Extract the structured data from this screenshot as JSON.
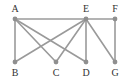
{
  "graph": {
    "nodes": [
      {
        "id": "A",
        "label": "A",
        "x": 15,
        "y": 19,
        "label_x": 15,
        "label_y": 12
      },
      {
        "id": "E",
        "label": "E",
        "x": 86,
        "y": 19,
        "label_x": 86,
        "label_y": 12
      },
      {
        "id": "F",
        "label": "F",
        "x": 115,
        "y": 19,
        "label_x": 115,
        "label_y": 12
      },
      {
        "id": "B",
        "label": "B",
        "x": 15,
        "y": 62,
        "label_x": 15,
        "label_y": 76
      },
      {
        "id": "C",
        "label": "C",
        "x": 56,
        "y": 62,
        "label_x": 56,
        "label_y": 76
      },
      {
        "id": "D",
        "label": "D",
        "x": 86,
        "y": 62,
        "label_x": 86,
        "label_y": 76
      },
      {
        "id": "G",
        "label": "G",
        "x": 115,
        "y": 62,
        "label_x": 115,
        "label_y": 76
      }
    ],
    "edges": [
      [
        "A",
        "E"
      ],
      [
        "E",
        "F"
      ],
      [
        "A",
        "B"
      ],
      [
        "A",
        "C"
      ],
      [
        "A",
        "D"
      ],
      [
        "E",
        "B"
      ],
      [
        "E",
        "C"
      ],
      [
        "E",
        "D"
      ],
      [
        "E",
        "G"
      ],
      [
        "F",
        "G"
      ]
    ],
    "colors": {
      "edge": "#9a9a9a",
      "node": "#8f8f8f",
      "label": "#333333",
      "background": "#ffffff"
    }
  }
}
